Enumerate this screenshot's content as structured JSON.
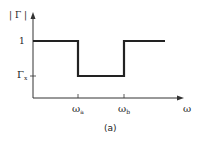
{
  "diagram": {
    "y_axis_label": "| Γ |",
    "x_axis_label": "ω",
    "caption": "(a)",
    "y_ticks": [
      {
        "label": "1"
      },
      {
        "main": "Γ",
        "sub": "x"
      }
    ],
    "x_ticks": [
      {
        "main": "ω",
        "sub": "a"
      },
      {
        "main": "ω",
        "sub": "b"
      }
    ],
    "curve_description": "Reflection coefficient magnitude equals 1 outside band, drops to Γx between ωa and ωb",
    "line_color": "#222222"
  }
}
